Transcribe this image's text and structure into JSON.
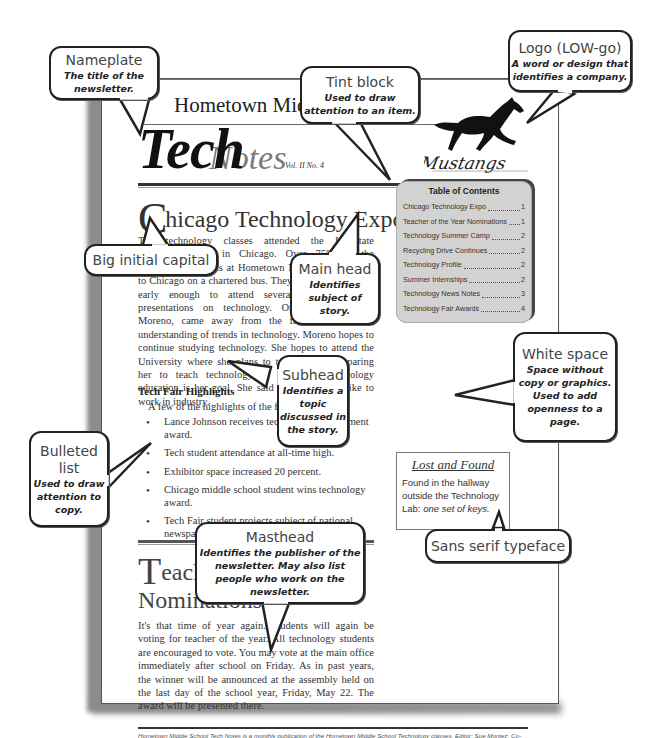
{
  "newsletter": {
    "school_name": "Hometown Middle School",
    "title_part1": "Tech",
    "title_part2": "Notes",
    "volume": "Vol. II No. 4",
    "logo_text": "Mustangs",
    "article1": {
      "dropcap": "C",
      "headline_rest": "hicago Technology Expo",
      "body": "The technology classes attended the Interstate Technology Fair in Chicago. Over 75% of the technology students at Hometown Middle School rode to Chicago on a chartered bus. They arrived in Chicago early enough to attend several workshops and presentations on technology. One student, Alma Moreno, came away from the fair with a better understanding of trends in technology. Moreno hopes to continue studying technology. She hopes to attend the University where she plans to take courses preparing her to teach technology. A career in technology education is her goal. She said she might also like to work in industry.",
      "subhead": "Tech Fair Highlights",
      "intro": "A few of the highlights of the fair:",
      "bullets": [
        "Lance Johnson receives technology achievement award.",
        "Tech student attendance at all-time high.",
        "Exhibitor space increased 20 percent.",
        "Chicago middle school student wins technology award.",
        "Tech Fair student projects subject of national newspaper story."
      ]
    },
    "article2": {
      "dropcap": "T",
      "headline_line1_rest": "eacher of the Year",
      "headline_line2": "Nominations",
      "body": "It's that time of year again. Students will again be voting for teacher of the year. All technology students are encouraged to vote. You may vote at the main office immediately after school on Friday. As in past years, the winner will be announced at the assembly held on the last day of the school year, Friday, May 22. The award will be presented there."
    },
    "toc": {
      "title": "Table of Contents",
      "items": [
        {
          "label": "Chicago Technology Expo",
          "page": "1"
        },
        {
          "label": "Teacher of the Year Nominations",
          "page": "1"
        },
        {
          "label": "Technology Summer Camp",
          "page": "2"
        },
        {
          "label": "Recycling Drive Continues",
          "page": "2"
        },
        {
          "label": "Technology Profile",
          "page": "2"
        },
        {
          "label": "Summer Internships",
          "page": "2"
        },
        {
          "label": "Technology News Notes",
          "page": "3"
        },
        {
          "label": "Technology Fair Awards",
          "page": "4"
        }
      ]
    },
    "lost_found": {
      "title": "Lost and Found",
      "body": "Found in the hallway outside the Technology Lab:",
      "body_italic": "one set of keys."
    },
    "masthead": "Hometown Middle School Tech Notes is a monthly publication of the Hometown Middle School Technology classes. Editor: Sue Montez. Co-Editor: James Coffey. Proofreaders: Kirk Johnson, Peter Nguyen, and Monica King. Copies are free to all requesting them in writing."
  },
  "callouts": {
    "nameplate": {
      "title": "Nameplate",
      "desc": "The title of the newsletter."
    },
    "tint_block": {
      "title": "Tint block",
      "desc": "Used to draw attention to an item."
    },
    "logo": {
      "title": "Logo (LOW-go)",
      "desc": "A word or design that identifies a company."
    },
    "big_initial": {
      "title": "Big initial capital"
    },
    "main_head": {
      "title": "Main head",
      "desc": "Identifies subject of story."
    },
    "subhead": {
      "title": "Subhead",
      "desc": "Identifies a topic discussed in the story."
    },
    "white_space": {
      "title": "White space",
      "desc": "Space without copy or graphics. Used to add openness to a page."
    },
    "bulleted_list": {
      "title": "Bulleted list",
      "desc": "Used to draw attention to copy."
    },
    "sans_serif": {
      "title": "Sans serif typeface"
    },
    "masthead": {
      "title": "Masthead",
      "desc": "Identifies the publisher of the newsletter. May also list people who work on the newsletter."
    }
  }
}
